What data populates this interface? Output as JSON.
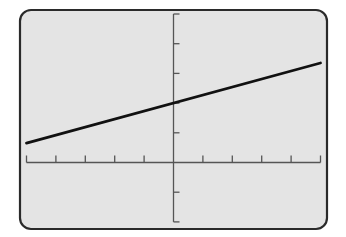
{
  "chart_data": {
    "type": "line",
    "title": "",
    "xlabel": "",
    "ylabel": "",
    "xlim": [
      -5,
      5
    ],
    "ylim": [
      -2,
      5
    ],
    "xscl": 1,
    "yscl": 1,
    "grid": false,
    "legend": null,
    "series": [
      {
        "name": "y = 0.27x + 2",
        "slope": 0.27,
        "intercept": 2,
        "x": [
          -5,
          5
        ],
        "y": [
          0.65,
          3.35
        ]
      }
    ],
    "x_tick_values": [
      -5,
      -4,
      -3,
      -2,
      -1,
      1,
      2,
      3,
      4,
      5
    ],
    "y_tick_values": [
      -2,
      -1,
      1,
      2,
      3,
      4,
      5
    ],
    "tick_labels_shown": false
  },
  "colors": {
    "screen_bg": "#e4e4e4",
    "frame": "#2a2a2a",
    "axis": "#555555",
    "line": "#111111",
    "page_bg": "#ffffff"
  },
  "layout": {
    "screen": {
      "x": 20,
      "y": 10,
      "w": 307,
      "h": 219,
      "r": 11
    },
    "origin": {
      "x": 173.5,
      "y": 162.5
    },
    "px_per_unit_x": 29.4,
    "px_per_unit_y": 29.7
  }
}
